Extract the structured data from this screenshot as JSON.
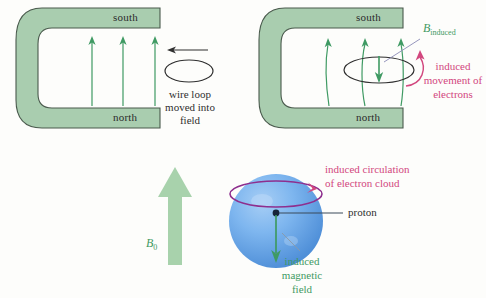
{
  "figure": {
    "background_color": "#fdfdfb"
  },
  "colors": {
    "magnet_fill": "#a9cdaf",
    "magnet_stroke": "#4a5a4d",
    "field_line_green": "#3f9a63",
    "arrow_block_green": "#a8d2ac",
    "pink": "#d2477e",
    "purple_ring": "#8e2f8e",
    "sphere_blue": "#74b0ec",
    "sphere_blue_dark": "#4f92dc",
    "text_dark": "#2f2f2f",
    "leader_line": "#6a7a8a"
  },
  "panels": {
    "left_magnet": {
      "name": "horseshoe magnet without loop",
      "south_label": "south",
      "north_label": "north",
      "field_lines": 3,
      "field_direction": "up",
      "loop": {
        "shape": "ellipse",
        "motion_arrow_direction": "left",
        "caption_lines": [
          "wire loop",
          "moved into",
          "field"
        ]
      }
    },
    "right_magnet": {
      "name": "horseshoe magnet with loop inserted",
      "south_label": "south",
      "north_label": "north",
      "field_lines": 3,
      "field_direction": "up",
      "induced_field_symbol": "B",
      "induced_field_subscript": "induced",
      "induced_arrow_direction": "down",
      "electron_caption_lines": [
        "induced",
        "movement of",
        "electrons"
      ]
    },
    "atom": {
      "name": "atom in external magnetic field",
      "external_field_symbol": "B",
      "external_field_subscript": "0",
      "external_field_direction": "up",
      "circulation_caption_lines": [
        "induced circulation",
        "of electron cloud"
      ],
      "proton_label": "proton",
      "induced_field_caption_lines": [
        "induced",
        "magnetic",
        "field"
      ],
      "induced_field_direction": "down"
    }
  }
}
